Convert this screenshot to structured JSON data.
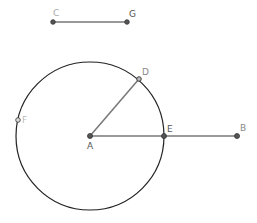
{
  "diagram": {
    "type": "geometry-construction",
    "colors": {
      "segment": "#777777",
      "circle": "#222222",
      "point_dark": "#444444",
      "point_light": "#888888",
      "label_light": "#999999",
      "label_dark": "#555555"
    },
    "points": {
      "A": {
        "label": "A",
        "x": 90,
        "y": 136
      },
      "B": {
        "label": "B",
        "x": 237,
        "y": 136
      },
      "C": {
        "label": "C",
        "x": 53,
        "y": 22
      },
      "D": {
        "label": "D",
        "x": 139,
        "y": 79
      },
      "E": {
        "label": "E",
        "x": 164,
        "y": 136
      },
      "F": {
        "label": "F",
        "x": 18,
        "y": 120
      },
      "G": {
        "label": "G",
        "x": 127,
        "y": 22
      }
    },
    "segments": [
      {
        "from": "C",
        "to": "G"
      },
      {
        "from": "A",
        "to": "B"
      },
      {
        "from": "A",
        "to": "D"
      }
    ],
    "circles": [
      {
        "center": "A",
        "radius": 74
      }
    ]
  }
}
